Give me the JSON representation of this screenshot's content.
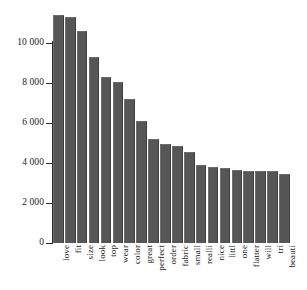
{
  "chart_data": {
    "type": "bar",
    "title": "",
    "subtitle": "",
    "xlabel": "",
    "ylabel": "",
    "ylim": [
      0,
      12000
    ],
    "grid": false,
    "legend": null,
    "orientation": "vertical",
    "bar_color": "#565656",
    "axis_color": "#2b2b2b",
    "background_color": "#ffffff",
    "ytick_labels": [
      "0",
      "2 000",
      "4 000",
      "6 000",
      "8 000",
      "10 000"
    ],
    "ytick_values": [
      0,
      2000,
      4000,
      6000,
      8000,
      10000
    ],
    "categories": [
      "love",
      "fit",
      "size",
      "look",
      "top",
      "wear",
      "color",
      "great",
      "perfect",
      "order",
      "fabric",
      "small",
      "realli",
      "nice",
      "littl",
      "one",
      "flatter",
      "will",
      "tri",
      "beauti"
    ],
    "values": [
      11400,
      11300,
      10600,
      9300,
      8300,
      8050,
      7200,
      6100,
      5200,
      4950,
      4850,
      4550,
      3900,
      3800,
      3750,
      3650,
      3600,
      3620,
      3580,
      3450
    ]
  }
}
